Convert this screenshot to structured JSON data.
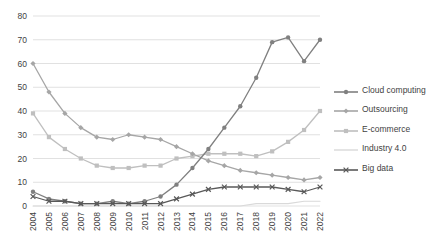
{
  "chart_data": {
    "type": "line",
    "title": "",
    "xlabel": "",
    "ylabel": "",
    "ylim": [
      0,
      80
    ],
    "ytick_step": 10,
    "grid": true,
    "legend_position": "right",
    "categories": [
      "2004",
      "2005",
      "2006",
      "2007",
      "2008",
      "2009",
      "2010",
      "2011",
      "2012",
      "2013",
      "2014",
      "2015",
      "2016",
      "2017",
      "2018",
      "2019",
      "2020",
      "2021",
      "2022"
    ],
    "yticks": [
      "0",
      "10",
      "20",
      "30",
      "40",
      "50",
      "60",
      "70",
      "80"
    ],
    "series": [
      {
        "name": "Cloud computing",
        "color": "#808080",
        "marker": "circle",
        "values": [
          6,
          3,
          2,
          1,
          1,
          2,
          1,
          2,
          4,
          9,
          16,
          24,
          33,
          42,
          54,
          69,
          71,
          61,
          70
        ]
      },
      {
        "name": "Outsourcing",
        "color": "#a6a6a6",
        "marker": "diamond",
        "values": [
          60,
          48,
          39,
          33,
          29,
          28,
          30,
          29,
          28,
          25,
          22,
          19,
          17,
          15,
          14,
          13,
          12,
          11,
          12
        ]
      },
      {
        "name": "E-commerce",
        "color": "#bfbfbf",
        "marker": "square",
        "values": [
          39,
          29,
          24,
          20,
          17,
          16,
          16,
          17,
          17,
          20,
          21,
          22,
          22,
          22,
          21,
          23,
          27,
          32,
          40
        ]
      },
      {
        "name": "Industry 4.0",
        "color": "#d9d9d9",
        "marker": "none",
        "values": [
          0,
          0,
          0,
          0,
          0,
          0,
          0,
          0,
          0,
          0,
          0,
          0,
          0,
          0,
          1,
          1,
          1,
          2,
          2
        ]
      },
      {
        "name": "Big data",
        "color": "#595959",
        "marker": "cross",
        "values": [
          4,
          2,
          2,
          1,
          1,
          1,
          1,
          1,
          1,
          3,
          5,
          7,
          8,
          8,
          8,
          8,
          7,
          6,
          8
        ]
      }
    ]
  }
}
